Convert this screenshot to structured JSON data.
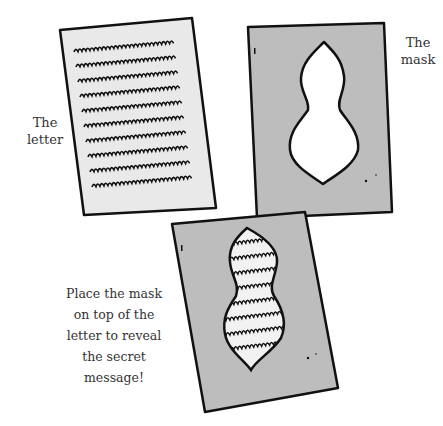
{
  "labels": {
    "letter": [
      "The",
      "letter"
    ],
    "mask": [
      "The",
      "mask"
    ],
    "instruction": [
      "Place the mask",
      "on top of the",
      "letter to reveal",
      "the secret",
      "message!"
    ]
  },
  "colors": {
    "paper_letter": "#e9e9e9",
    "paper_mask": "#bdbdbd",
    "outline": "#111111",
    "text": "#333333"
  },
  "figures": [
    {
      "name": "letter",
      "lines_of_scribble": 10
    },
    {
      "name": "mask",
      "cutout_shape": "gourd"
    },
    {
      "name": "mask-on-letter",
      "lines_of_scribble_visible": 8
    }
  ]
}
